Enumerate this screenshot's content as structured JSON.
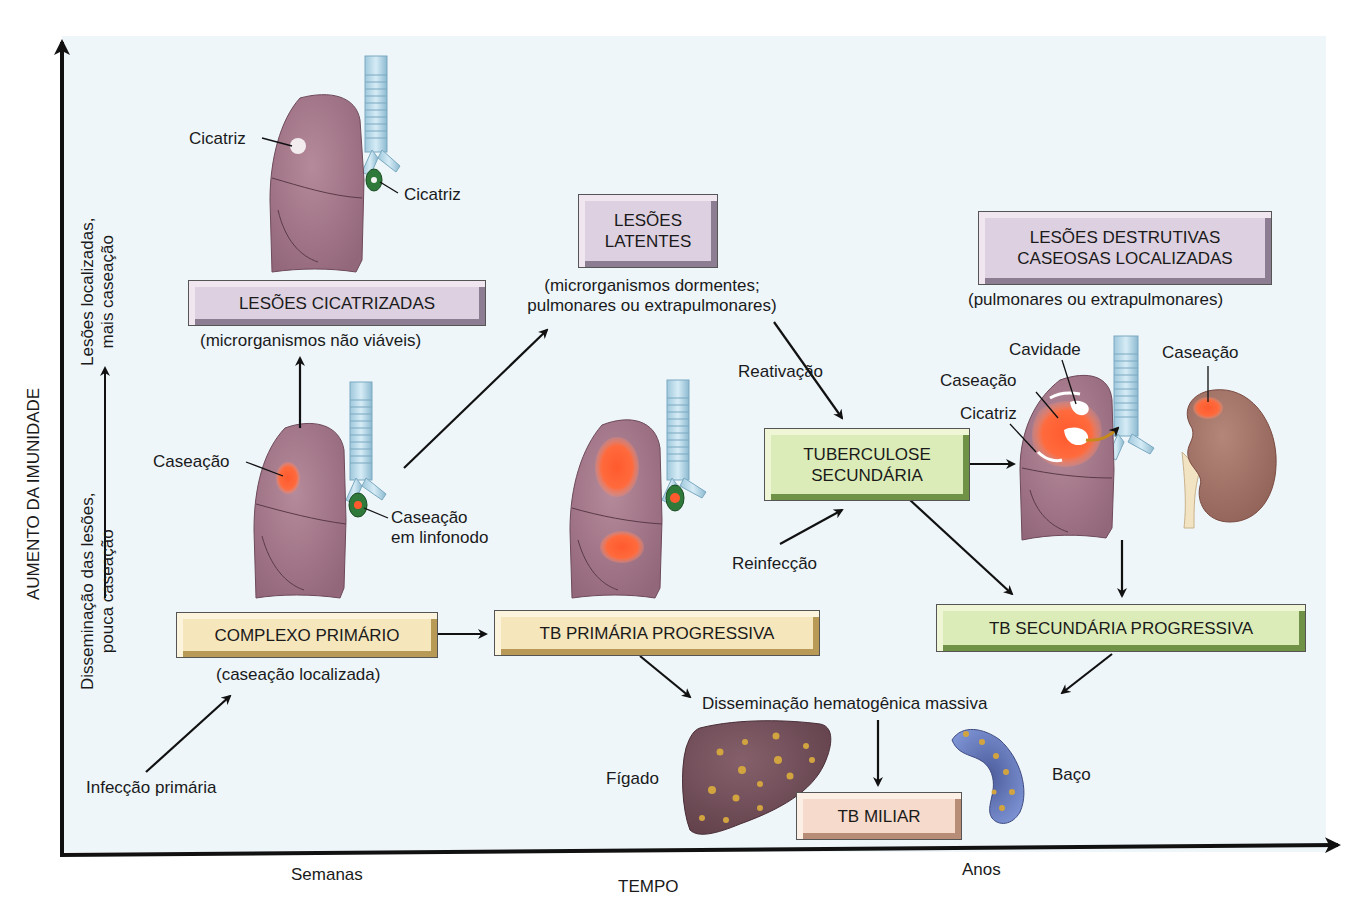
{
  "axes": {
    "y_title": "AUMENTO DA IMUNIDADE",
    "y_upper_label_line1": "Lesões localizadas,",
    "y_upper_label_line2": "mais caseação",
    "y_lower_label_line1": "Disseminação das lesões,",
    "y_lower_label_line2": "pouca caseação",
    "x_title": "TEMPO",
    "x_tick_weeks": "Semanas",
    "x_tick_years": "Anos"
  },
  "boxes": {
    "healed_lesions": {
      "label": "LESÕES CICATRIZADAS",
      "note": "(microrganismos não viáveis)",
      "color": "#ddd0e0"
    },
    "latent_lesions": {
      "label_line1": "LESÕES",
      "label_line2": "LATENTES",
      "note_line1": "(microrganismos dormentes;",
      "note_line2": "pulmonares ou extrapulmonares)",
      "color": "#ddd0e0"
    },
    "destructive_lesions": {
      "label_line1": "LESÕES DESTRUTIVAS",
      "label_line2": "CASEOSAS LOCALIZADAS",
      "note": "(pulmonares ou extrapulmonares)",
      "color": "#ddd0e0"
    },
    "primary_complex": {
      "label": "COMPLEXO PRIMÁRIO",
      "note": "(caseação localizada)",
      "color": "#f6e6bc"
    },
    "progressive_primary": {
      "label": "TB PRIMÁRIA PROGRESSIVA",
      "color": "#f6e6bc"
    },
    "secondary_tb": {
      "label_line1": "TUBERCULOSE",
      "label_line2": "SECUNDÁRIA",
      "color": "#dcecb8"
    },
    "progressive_secondary": {
      "label": "TB SECUNDÁRIA PROGRESSIVA",
      "color": "#dcecb8"
    },
    "miliary_tb": {
      "label": "TB MILIAR",
      "color": "#f6dacb"
    }
  },
  "labels": {
    "scar_lung": "Cicatriz",
    "scar_node": "Cicatriz",
    "caseation_lung": "Caseação",
    "caseation_node_line1": "Caseação",
    "caseation_node_line2": "em linfonodo",
    "primary_infection": "Infecção primária",
    "reactivation": "Reativação",
    "reinfection": "Reinfecção",
    "cavity": "Cavidade",
    "caseation_secondary": "Caseação",
    "scar_secondary": "Cicatriz",
    "caseation_kidney": "Caseação",
    "hematogenous_spread": "Disseminação hematogênica massiva",
    "liver": "Fígado",
    "spleen": "Baço"
  },
  "caption_partial": "fonte cortada no rodapé"
}
